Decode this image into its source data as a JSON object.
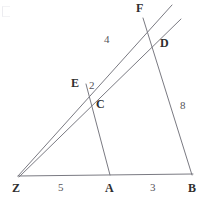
{
  "figure": {
    "width": 202,
    "height": 210,
    "background_color": "#ffffff",
    "line_color": "#7a7a82",
    "label_color": "#2e2e2e",
    "measure_color": "#55555a"
  },
  "points": [
    {
      "id": "Z",
      "label": "Z",
      "x": 18,
      "y": 176,
      "label_x": 12,
      "label_y": 184,
      "kind": "vertex"
    },
    {
      "id": "A",
      "label": "A",
      "x": 110,
      "y": 176,
      "label_x": 105,
      "label_y": 184,
      "kind": "vertex"
    },
    {
      "id": "B",
      "label": "B",
      "x": 192,
      "y": 176,
      "label_x": 188,
      "label_y": 184,
      "kind": "vertex"
    },
    {
      "id": "C",
      "label": "C",
      "x": 95,
      "y": 98,
      "label_x": 96,
      "label_y": 99,
      "kind": "vertex"
    },
    {
      "id": "E",
      "label": "E",
      "x": 87,
      "y": 86,
      "label_x": 72,
      "label_y": 78,
      "kind": "vertex"
    },
    {
      "id": "D",
      "label": "D",
      "x": 156,
      "y": 42,
      "label_x": 160,
      "label_y": 38,
      "kind": "vertex"
    },
    {
      "id": "F",
      "label": "F",
      "x": 143,
      "y": 18,
      "label_x": 137,
      "label_y": 3,
      "kind": "vertex"
    }
  ],
  "segments": [
    {
      "id": "ZB",
      "from": "Z",
      "to": "B",
      "x1": 18,
      "y1": 176,
      "x2": 193,
      "y2": 174
    },
    {
      "id": "ZF-ray",
      "from": "Z",
      "to": "F",
      "x1": 18,
      "y1": 176,
      "x2": 172,
      "y2": 5
    },
    {
      "id": "ZD-ray",
      "from": "Z",
      "to": "D",
      "x1": 19,
      "y1": 177,
      "x2": 181,
      "y2": 19
    },
    {
      "id": "FB",
      "from": "F",
      "to": "B",
      "x1": 143,
      "y1": 18,
      "x2": 192,
      "y2": 175
    },
    {
      "id": "AE",
      "from": "A",
      "to": "E",
      "x1": 110,
      "y1": 175,
      "x2": 86,
      "y2": 84
    }
  ],
  "measures": [
    {
      "id": "ZA",
      "value": "5",
      "x": 60,
      "y": 185,
      "on": "ZB"
    },
    {
      "id": "AB",
      "value": "3",
      "x": 152,
      "y": 185,
      "on": "ZB"
    },
    {
      "id": "DB",
      "value": "8",
      "x": 182,
      "y": 104,
      "on": "FB"
    },
    {
      "id": "EF",
      "value": "4",
      "x": 106,
      "y": 37,
      "on": "ZF-ray"
    },
    {
      "id": "CE",
      "value": "2",
      "x": 91,
      "y": 84,
      "on": "AE"
    }
  ]
}
